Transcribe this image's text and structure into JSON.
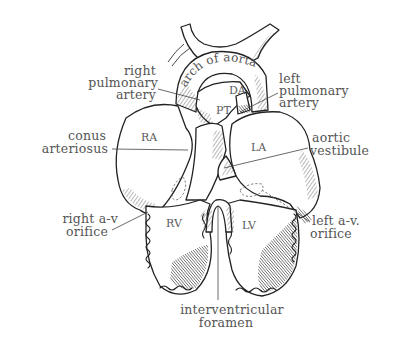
{
  "figure": {
    "labels": {
      "right_pulmonary_artery": [
        "right",
        "pulmonary",
        "artery"
      ],
      "left_pulmonary_artery": [
        "left",
        "pulmonary",
        "artery"
      ],
      "arch_of_aorta": "arch of aorta",
      "conus_arteriosus": [
        "conus",
        "arteriosus"
      ],
      "aortic_vestibule": [
        "aortic",
        "vestibule"
      ],
      "right_av_orifice": [
        "right a-v",
        "orifice"
      ],
      "left_av_orifice": [
        "left a-v.",
        "orifice"
      ],
      "interventricular_foramen": [
        "interventricular",
        "foramen"
      ]
    },
    "chamber_labels": {
      "DA": "DA",
      "PT": "PT",
      "RA": "RA",
      "LA": "LA",
      "RV": "RV",
      "LV": "LV"
    },
    "colors": {
      "ink": "#222222",
      "label_text": "#555555",
      "background": "#ffffff"
    }
  }
}
